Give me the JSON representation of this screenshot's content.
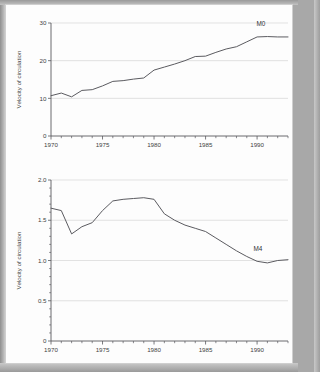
{
  "page": {
    "background_color": "#fdfdfd",
    "border_color": "#a8a8a8"
  },
  "chart_data": [
    {
      "type": "line",
      "id": "m0-velocity",
      "title": "",
      "xlabel": "",
      "ylabel": "Velocity of circulation",
      "xlim": [
        1970,
        1993
      ],
      "ylim": [
        0,
        30
      ],
      "yticks": [
        0,
        10,
        20,
        30
      ],
      "ytick_labels": [
        "0",
        "10",
        "20",
        "30"
      ],
      "xticks": [
        1970,
        1975,
        1980,
        1985,
        1990
      ],
      "xtick_labels": [
        "1970",
        "1975",
        "1980",
        "1985",
        "1990"
      ],
      "xtick_minor_step": 1,
      "grid": "horizontal",
      "legend_position": "inline-right",
      "series": [
        {
          "name": "M0",
          "label": "M0",
          "x": [
            1970,
            1971,
            1972,
            1973,
            1974,
            1975,
            1976,
            1977,
            1978,
            1979,
            1980,
            1981,
            1982,
            1983,
            1984,
            1985,
            1986,
            1987,
            1988,
            1989,
            1990,
            1991,
            1992,
            1993
          ],
          "values": [
            10.7,
            11.4,
            10.4,
            12.1,
            12.3,
            13.3,
            14.5,
            14.7,
            15.1,
            15.4,
            17.5,
            18.3,
            19.1,
            20.0,
            21.1,
            21.2,
            22.2,
            23.1,
            23.7,
            25.0,
            26.3,
            26.4,
            26.3,
            26.3
          ]
        }
      ]
    },
    {
      "type": "line",
      "id": "m4-velocity",
      "title": "",
      "xlabel": "",
      "ylabel": "Velocity of circulation",
      "xlim": [
        1970,
        1993
      ],
      "ylim": [
        0,
        2.0
      ],
      "yticks": [
        0,
        0.5,
        1.0,
        1.5,
        2.0
      ],
      "ytick_labels": [
        "0",
        "0.5",
        "1.0",
        "1.5",
        "2.0"
      ],
      "ytick_minor_step": 0.1,
      "xticks": [
        1970,
        1975,
        1980,
        1985,
        1990
      ],
      "xtick_labels": [
        "1970",
        "1975",
        "1980",
        "1985",
        "1990"
      ],
      "xtick_minor_step": 1,
      "grid": "horizontal",
      "legend_position": "inline-right",
      "series": [
        {
          "name": "M4",
          "label": "M4",
          "x": [
            1970,
            1971,
            1972,
            1973,
            1974,
            1975,
            1976,
            1977,
            1978,
            1979,
            1980,
            1981,
            1982,
            1983,
            1984,
            1985,
            1986,
            1987,
            1988,
            1989,
            1990,
            1991,
            1992,
            1993
          ],
          "values": [
            1.65,
            1.62,
            1.33,
            1.42,
            1.47,
            1.62,
            1.74,
            1.76,
            1.77,
            1.78,
            1.76,
            1.58,
            1.5,
            1.44,
            1.4,
            1.36,
            1.28,
            1.2,
            1.12,
            1.05,
            0.99,
            0.97,
            1.0,
            1.01
          ]
        }
      ]
    }
  ]
}
